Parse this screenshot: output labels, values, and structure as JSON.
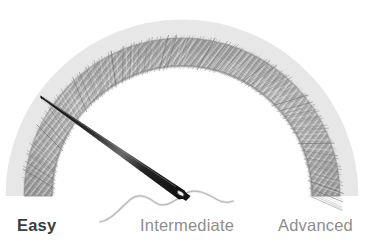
{
  "figure": {
    "background_color": "#ffffff",
    "width": 378,
    "height": 247
  },
  "chart_data": {
    "type": "gauge",
    "title": "",
    "subtitle": "",
    "xlabel": "",
    "ylabel": "",
    "categories": [
      "Easy",
      "Intermediate",
      "Advanced"
    ],
    "values": [
      1,
      0,
      0
    ],
    "needle_value": 0.27,
    "needle_angle_deg": 131,
    "axis_range_deg": [
      180,
      0
    ],
    "grid": false,
    "legend": false,
    "annotations": [
      "Semicircular gauge rendered as a twisted gray yarn cord",
      "Indicator is a sewing needle with threaded eye pointing into the Easy zone"
    ],
    "segments": [
      {
        "label": "Easy",
        "start_deg": 180,
        "end_deg": 120,
        "color": "#9a9a9a"
      },
      {
        "label": "Intermediate",
        "start_deg": 120,
        "end_deg": 60,
        "color": "#9a9a9a"
      },
      {
        "label": "Advanced",
        "start_deg": 60,
        "end_deg": 0,
        "color": "#9a9a9a"
      }
    ]
  },
  "gauge": {
    "center_x": 182,
    "center_y": 196,
    "outer_radius": 158,
    "inner_radius": 130,
    "arc_color": "#9b9b9b",
    "arc_color_light": "#cfcfcf",
    "arc_color_dark": "#6e6e6e"
  },
  "needle": {
    "name": "sewing-needle",
    "tip_x": 41,
    "tip_y": 96,
    "eye_x": 188,
    "eye_y": 196,
    "color": "#1c1c1c"
  },
  "thread": {
    "name": "sewing-thread",
    "color": "#a5a5a5",
    "start_x": 100,
    "start_y": 222,
    "end_x": 233,
    "end_y": 201
  },
  "labels": {
    "easy": "Easy",
    "intermediate": "Intermediate",
    "advanced": "Advanced",
    "easy_color": "#3c3c3c",
    "muted_color": "#8e8e8e"
  }
}
